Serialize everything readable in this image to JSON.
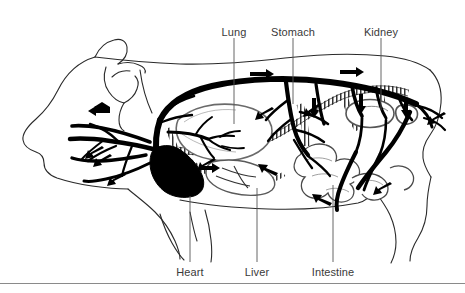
{
  "figure": {
    "kind": "anatomical-diagram",
    "background_color": "#ffffff",
    "ink_color": "#000000",
    "label_color": "#3a3a3a",
    "rule_color": "#8a8a8a",
    "width": 465,
    "height": 293
  },
  "labels": {
    "top": [
      {
        "name": "lung",
        "text": "Lung",
        "x": 234,
        "text_y": 33,
        "line_x": 234,
        "line_y1": 38,
        "line_y2": 124
      },
      {
        "name": "stomach",
        "text": "Stomach",
        "x": 293,
        "text_y": 33,
        "line_x": 293,
        "line_y1": 38,
        "line_y2": 104
      },
      {
        "name": "kidney",
        "text": "Kidney",
        "x": 381,
        "text_y": 33,
        "line_x": 381,
        "line_y1": 38,
        "line_y2": 110
      },
      {
        "name": "tail-hint",
        "text": "",
        "x": 0,
        "text_y": 0,
        "line_x": 0,
        "line_y1": 0,
        "line_y2": 0
      }
    ],
    "bottom": [
      {
        "name": "heart",
        "text": "Heart",
        "x": 190,
        "text_y": 274,
        "line_x": 190,
        "line_y1": 196,
        "line_y2": 262
      },
      {
        "name": "liver",
        "text": "Liver",
        "x": 257,
        "text_y": 274,
        "line_x": 257,
        "line_y1": 188,
        "line_y2": 262
      },
      {
        "name": "intestine",
        "text": "Intestine",
        "x": 333,
        "text_y": 274,
        "line_x": 333,
        "line_y1": 185,
        "line_y2": 262
      }
    ]
  },
  "legend": {
    "artery_style": "solid-black",
    "vein_style": "hatched-outline",
    "flow_marker": "arrowhead"
  },
  "footer": {
    "rule_y": 283
  }
}
